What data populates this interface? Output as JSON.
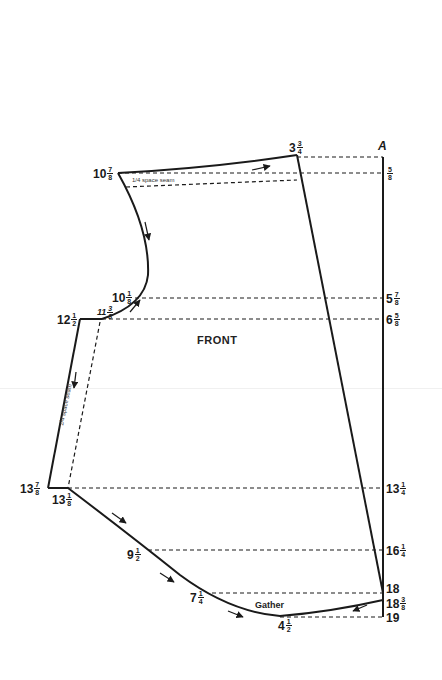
{
  "diagram": {
    "title": "FRONT",
    "corner_label": "A",
    "gather_label": "Gather",
    "seam_note_top": "space seam",
    "seam_note_top_frac": {
      "num": "1",
      "den": "4"
    },
    "seam_note_side": "space seam",
    "seam_note_side_frac": {
      "num": "1",
      "den": "4"
    }
  },
  "right_labels": [
    {
      "id": "r-5-8",
      "whole": "",
      "num": "5",
      "den": "8"
    },
    {
      "id": "r-5-7-8",
      "whole": "5",
      "num": "7",
      "den": "8"
    },
    {
      "id": "r-6-5-8",
      "whole": "6",
      "num": "5",
      "den": "8"
    },
    {
      "id": "r-13-1-4",
      "whole": "13",
      "num": "1",
      "den": "4"
    },
    {
      "id": "r-16-1-4",
      "whole": "16",
      "num": "1",
      "den": "4"
    },
    {
      "id": "r-18",
      "whole": "18",
      "num": "",
      "den": ""
    },
    {
      "id": "r-18-3-8",
      "whole": "18",
      "num": "3",
      "den": "8"
    },
    {
      "id": "r-19",
      "whole": "19",
      "num": "",
      "den": ""
    }
  ],
  "left_labels": [
    {
      "id": "l-3-3-4",
      "whole": "3",
      "num": "3",
      "den": "4"
    },
    {
      "id": "l-10-7-8",
      "whole": "10",
      "num": "7",
      "den": "8"
    },
    {
      "id": "l-10-1-8",
      "whole": "10",
      "num": "1",
      "den": "8"
    },
    {
      "id": "l-11-3-8",
      "whole": "11",
      "num": "3",
      "den": "8"
    },
    {
      "id": "l-12-1-2",
      "whole": "12",
      "num": "1",
      "den": "2"
    },
    {
      "id": "l-13-7-8",
      "whole": "13",
      "num": "7",
      "den": "8"
    },
    {
      "id": "l-13-1-8",
      "whole": "13",
      "num": "1",
      "den": "8"
    },
    {
      "id": "l-9-1-2",
      "whole": "9",
      "num": "1",
      "den": "2"
    },
    {
      "id": "l-7-1-4",
      "whole": "7",
      "num": "1",
      "den": "4"
    },
    {
      "id": "l-4-1-2",
      "whole": "4",
      "num": "1",
      "den": "2"
    }
  ],
  "colors": {
    "ink": "#1a1a1a",
    "paper": "#ffffff"
  }
}
